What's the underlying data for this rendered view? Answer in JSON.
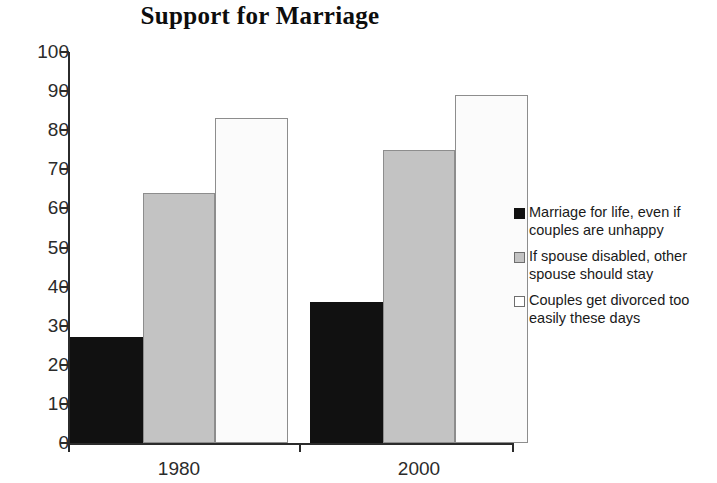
{
  "chart_data": {
    "type": "bar",
    "title": "Support for Marriage",
    "xlabel": "",
    "ylabel": "",
    "categories": [
      "1980",
      "2000"
    ],
    "series": [
      {
        "name": "Marriage for life, even if couples are unhappy",
        "values": [
          27,
          36
        ],
        "color": "#111111"
      },
      {
        "name": "If spouse disabled, other spouse should stay",
        "values": [
          64,
          75
        ],
        "color": "#c3c3c3"
      },
      {
        "name": "Couples get divorced too easily these days",
        "values": [
          83,
          89
        ],
        "color": "#fbfbfb"
      }
    ],
    "ylim": [
      0,
      100
    ],
    "y_ticks": [
      "0",
      "10",
      "20",
      "30",
      "40",
      "50",
      "60",
      "70",
      "80",
      "90",
      "100"
    ],
    "grid": false,
    "legend_position": "right"
  },
  "axis": {
    "y_labels": [
      "100",
      "90",
      "80",
      "70",
      "60",
      "50",
      "40",
      "30",
      "20",
      "10",
      "0"
    ],
    "x_labels": [
      "1980",
      "2000"
    ]
  },
  "legend": {
    "items": [
      {
        "label": "Marriage for life, even if couples are unhappy"
      },
      {
        "label": "If spouse disabled, other spouse should stay"
      },
      {
        "label": "Couples get divorced too easily these days"
      }
    ]
  }
}
